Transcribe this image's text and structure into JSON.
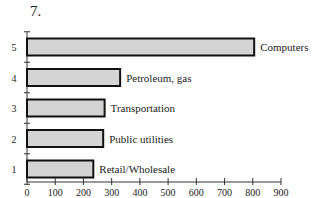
{
  "figure_label": "7.",
  "chart_data": {
    "type": "bar",
    "orientation": "horizontal",
    "title": "7.",
    "categories": [
      "1",
      "2",
      "3",
      "4",
      "5"
    ],
    "bar_labels": [
      "Retail/Wholesale",
      "Public utilities",
      "Transportation",
      "Petroleum, gas",
      "Computers"
    ],
    "values": [
      235,
      270,
      275,
      330,
      805
    ],
    "xlabel": "Transfers",
    "ylabel": "",
    "xlim": [
      0,
      900
    ],
    "xticks": [
      0,
      100,
      200,
      300,
      400,
      500,
      600,
      700,
      800,
      900
    ],
    "grid": false,
    "legend": null,
    "bar_fill": "#d4d4d4",
    "bar_edge": "#111111"
  }
}
